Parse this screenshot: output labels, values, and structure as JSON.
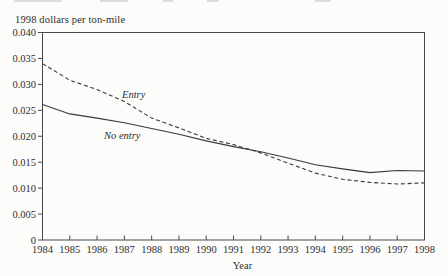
{
  "chart_data": {
    "type": "line",
    "ylabel": "1998 dollars per ton-mile",
    "xlabel": "Year",
    "x": [
      1984,
      1985,
      1986,
      1987,
      1988,
      1989,
      1990,
      1991,
      1992,
      1993,
      1994,
      1995,
      1996,
      1997,
      1998
    ],
    "x_tick_labels": [
      "1984",
      "1985",
      "1986",
      "1987",
      "1988",
      "1989",
      "1990",
      "1991",
      "1992",
      "1993",
      "1994",
      "1995",
      "1996",
      "1997",
      "1998"
    ],
    "y_tick_values": [
      0,
      0.005,
      0.01,
      0.015,
      0.02,
      0.025,
      0.03,
      0.035,
      0.04
    ],
    "y_tick_labels": [
      "0",
      "0.005",
      "0.010",
      "0.015",
      "0.020",
      "0.025",
      "0.030",
      "0.035",
      "0.040"
    ],
    "ylim": [
      0,
      0.04
    ],
    "grid": false,
    "legend": "inline-annotations",
    "frame": "full-box",
    "line_color": "#3a3a3a",
    "series": [
      {
        "name": "Entry",
        "line_style": "dashed",
        "color": "#3a3a3a",
        "values": [
          0.034,
          0.0308,
          0.029,
          0.0267,
          0.0235,
          0.0216,
          0.0196,
          0.0184,
          0.0168,
          0.0148,
          0.0129,
          0.0117,
          0.0111,
          0.0108,
          0.011
        ]
      },
      {
        "name": "No entry",
        "line_style": "solid",
        "color": "#3a3a3a",
        "values": [
          0.0261,
          0.0243,
          0.0235,
          0.0226,
          0.0215,
          0.0204,
          0.0191,
          0.018,
          0.017,
          0.0158,
          0.0145,
          0.0137,
          0.013,
          0.0134,
          0.0133
        ]
      }
    ],
    "annotations": [
      {
        "text": "Entry",
        "series": "Entry",
        "italic": true
      },
      {
        "text": "No entry",
        "series": "No entry",
        "italic": true
      }
    ]
  }
}
